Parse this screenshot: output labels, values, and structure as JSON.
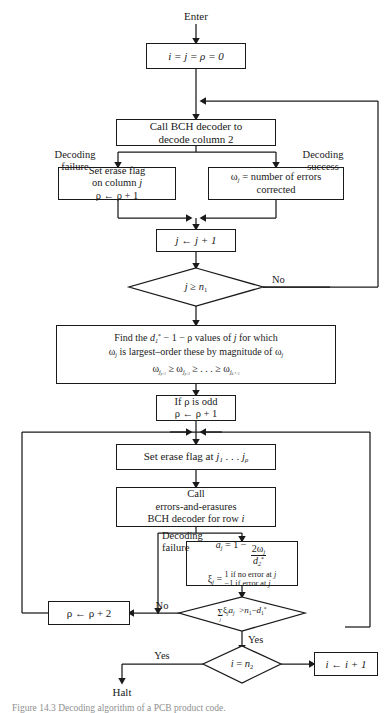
{
  "figure": {
    "domain": "flowchart-diagram",
    "title_caption": "Figure 14.3 Decoding algorithm of a PCB product code.",
    "stroke_color": "#1a1a1a",
    "background": "#ffffff"
  },
  "terminals": {
    "enter": "Enter",
    "halt": "Halt"
  },
  "nodes": {
    "init": {
      "name": "init-box",
      "text": "i = j = ρ = 0"
    },
    "call_bch_col": {
      "name": "call-bch-decoder-column-box",
      "line1": "Call BCH decoder to",
      "line2": "decode column 2"
    },
    "set_erase_col": {
      "name": "set-erase-flag-column-box",
      "line1": "Set erase flag",
      "line2": "on column j",
      "line3": "ρ ← ρ + 1"
    },
    "omega_count": {
      "name": "omega-errors-corrected-box",
      "line1": "ω_j = number of errors",
      "line2": "corrected"
    },
    "j_increment": {
      "name": "j-increment-box",
      "text": "j ← j + 1"
    },
    "find_values": {
      "name": "find-values-box",
      "line1": "Find the d₁* − 1 − ρ values of j for which",
      "line2": "ω_j is largest–order these by magnitude of ω_j",
      "line3": "ω_{j_{ρ+1}} ⩾ ω_{j_{ρ+2}} ⩾ . . . ⩾ ω_{j_{d₁*−1}}"
    },
    "rho_odd": {
      "name": "rho-odd-box",
      "line1": "If ρ is odd",
      "line2": "ρ ← ρ + 1"
    },
    "set_erase_j": {
      "name": "set-erase-flag-at-j-box",
      "text": "Set erase flag at j₁ . . . j_ρ"
    },
    "call_errors_erasures": {
      "name": "call-errors-and-erasures-decoder-box",
      "line1": "Call",
      "line2": "errors-and-erasures",
      "line3": "BCH decoder for row i"
    },
    "a_xi": {
      "name": "a-and-xi-definition-box",
      "line1": "a_j = 1 − 2ω_j / d₂*",
      "line2_label": "ξ_j =",
      "case1": "1 if no error at j",
      "case2": "−1 if error at j"
    },
    "rho_plus2": {
      "name": "rho-plus-two-box",
      "text": "ρ ← ρ + 2"
    },
    "i_increment": {
      "name": "i-increment-box",
      "text": "i ← i + 1"
    }
  },
  "decisions": {
    "j_ge_n1": {
      "name": "decision-j-ge-n1",
      "text": "j ⩾ n₁",
      "branch_no": "No"
    },
    "sum_test": {
      "name": "decision-sum-xi-a",
      "text": "Σ_j ξ_j a_j > n₁ − d₁*",
      "branch_no": "No",
      "branch_yes": "Yes"
    },
    "i_eq_n2": {
      "name": "decision-i-eq-n2",
      "text": "i = n₂",
      "branch_yes": "Yes"
    }
  },
  "edge_labels": {
    "decoding_failure_top": "Decoding\nfailure",
    "decoding_failure_top_l1": "Decoding",
    "decoding_failure_top_l2": "failure",
    "decoding_success_l1": "Decoding",
    "decoding_success_l2": "success",
    "decoding_failure_row_l1": "Decoding",
    "decoding_failure_row_l2": "failure",
    "no_top": "No",
    "no_bottom": "No",
    "yes_sum": "Yes",
    "yes_halt": "Yes"
  }
}
